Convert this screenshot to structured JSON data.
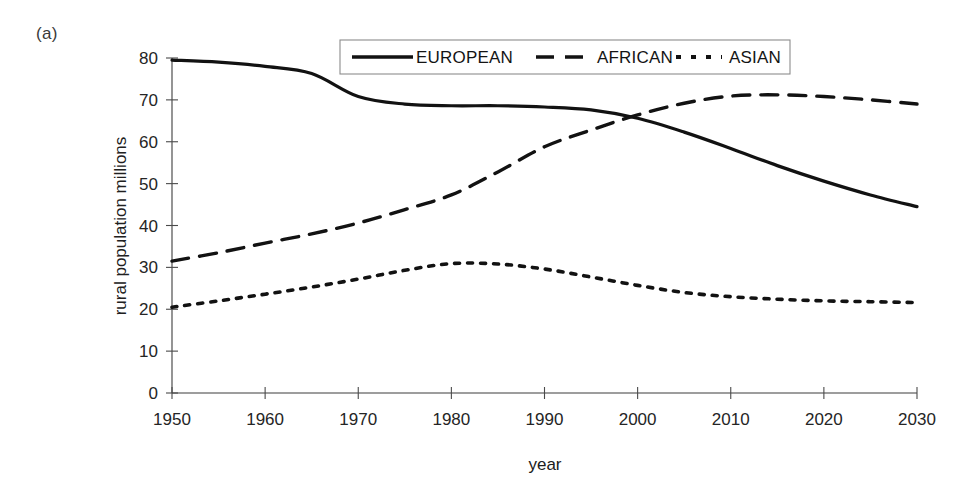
{
  "figure": {
    "panel_label": "(a)"
  },
  "chart_data": {
    "type": "line",
    "title": "",
    "xlabel": "year",
    "ylabel": "rural population  millions",
    "xlim": [
      1950,
      2030
    ],
    "ylim": [
      0,
      80
    ],
    "xticks": [
      1950,
      1960,
      1970,
      1980,
      1990,
      2000,
      2010,
      2020,
      2030
    ],
    "yticks": [
      0,
      10,
      20,
      30,
      40,
      50,
      60,
      70,
      80
    ],
    "grid": false,
    "legend_position": "top-center",
    "x": [
      1950,
      1955,
      1960,
      1965,
      1970,
      1975,
      1980,
      1985,
      1990,
      1995,
      2000,
      2005,
      2010,
      2015,
      2020,
      2025,
      2030
    ],
    "series": [
      {
        "name": "EUROPEAN",
        "style": "solid",
        "color": "#121212",
        "values": [
          79.5,
          79.0,
          78.0,
          76.3,
          70.8,
          69.0,
          68.6,
          68.6,
          68.3,
          67.6,
          65.6,
          62.3,
          58.4,
          54.3,
          50.6,
          47.3,
          44.5
        ]
      },
      {
        "name": "AFRICAN",
        "style": "dashed",
        "color": "#121212",
        "values": [
          31.5,
          33.5,
          35.8,
          38.0,
          40.6,
          43.8,
          47.3,
          52.8,
          58.8,
          62.8,
          66.4,
          69.2,
          70.9,
          71.2,
          70.8,
          70.0,
          69.0
        ]
      },
      {
        "name": "ASIAN",
        "style": "dotted",
        "color": "#121212",
        "values": [
          20.5,
          22.0,
          23.6,
          25.3,
          27.2,
          29.3,
          30.9,
          30.8,
          29.6,
          27.7,
          25.7,
          24.0,
          23.0,
          22.4,
          22.0,
          21.8,
          21.6
        ]
      }
    ],
    "legend": [
      {
        "label": "EUROPEAN",
        "style": "solid"
      },
      {
        "label": "AFRICAN",
        "style": "dashed"
      },
      {
        "label": "ASIAN",
        "style": "dotted"
      }
    ],
    "annotations": [
      {
        "text": "crossover EUROPEAN / AFRICAN",
        "x": 1998,
        "y": 66.5
      }
    ]
  }
}
